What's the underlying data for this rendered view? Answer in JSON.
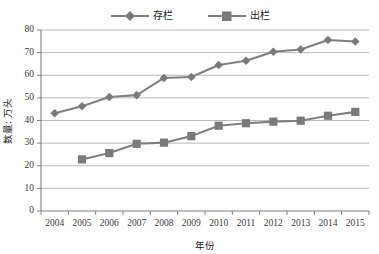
{
  "chart_data": {
    "type": "line",
    "title": "",
    "xlabel": "年份",
    "ylabel": "数量: 万头",
    "categories": [
      "2004",
      "2005",
      "2006",
      "2007",
      "2008",
      "2009",
      "2010",
      "2011",
      "2012",
      "2013",
      "2014",
      "2015"
    ],
    "series": [
      {
        "name": "存栏",
        "marker": "diamond",
        "color": "#808080",
        "values": [
          43.2,
          46.3,
          50.4,
          51.2,
          58.8,
          59.2,
          64.5,
          66.4,
          70.4,
          71.4,
          75.6,
          74.9
        ]
      },
      {
        "name": "出栏",
        "marker": "square",
        "color": "#808080",
        "values": [
          null,
          22.8,
          25.6,
          29.7,
          30.2,
          33.1,
          37.7,
          38.8,
          39.5,
          39.9,
          42.1,
          43.8
        ]
      }
    ],
    "ylim": [
      0,
      80
    ],
    "yticks": [
      0,
      10,
      20,
      30,
      40,
      50,
      60,
      70,
      80
    ],
    "ytick_labels": [
      "0",
      "10",
      "20",
      "30",
      "40",
      "50",
      "60",
      "70",
      "80"
    ],
    "grid": "horizontal",
    "legend_position": "top-center"
  },
  "legend": {
    "items": [
      {
        "label": "存栏",
        "marker": "diamond-marker-icon"
      },
      {
        "label": "出栏",
        "marker": "square-marker-icon"
      }
    ]
  },
  "colors": {
    "line": "#808080",
    "marker": "#7a7a7a",
    "grid": "#a6a6a6",
    "axis": "#808080",
    "text": "#303030"
  }
}
